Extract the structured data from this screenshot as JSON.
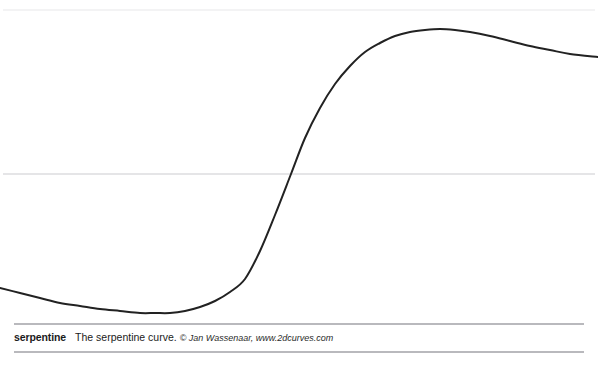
{
  "figure": {
    "background_color": "#ffffff",
    "width": 598,
    "height": 365
  },
  "rules": {
    "top_axis_color": "#efeff1",
    "mid_axis_color": "#dcdcdf",
    "caption_rule_color": "#b9b9bd"
  },
  "caption": {
    "name": "serpentine",
    "description": "The serpentine curve.",
    "credit": "© Jan Wassenaar, www.2dcurves.com"
  },
  "chart_data": {
    "type": "line",
    "title": "The serpentine curve.",
    "xlabel": "",
    "ylabel": "",
    "grid": false,
    "legend": null,
    "curve_color": "#222222",
    "curve_width": 2,
    "axis_lines": [
      {
        "name": "top-rule",
        "y_px": 10
      },
      {
        "name": "mid-axis",
        "y_px": 174
      }
    ],
    "xlim": [
      0,
      598
    ],
    "ylim": [
      323,
      0
    ],
    "annotations": [
      {
        "label": "minimum",
        "x": 155,
        "y": 313
      },
      {
        "label": "inflection",
        "x": 291,
        "y": 174
      },
      {
        "label": "maximum",
        "x": 440,
        "y": 29
      }
    ],
    "points": [
      {
        "x": 0,
        "y": 288
      },
      {
        "x": 20,
        "y": 293
      },
      {
        "x": 40,
        "y": 298
      },
      {
        "x": 60,
        "y": 303
      },
      {
        "x": 80,
        "y": 306
      },
      {
        "x": 100,
        "y": 309
      },
      {
        "x": 120,
        "y": 311
      },
      {
        "x": 140,
        "y": 313
      },
      {
        "x": 155,
        "y": 313
      },
      {
        "x": 170,
        "y": 313
      },
      {
        "x": 185,
        "y": 311
      },
      {
        "x": 200,
        "y": 307
      },
      {
        "x": 215,
        "y": 301
      },
      {
        "x": 230,
        "y": 292
      },
      {
        "x": 245,
        "y": 279
      },
      {
        "x": 260,
        "y": 251
      },
      {
        "x": 275,
        "y": 215
      },
      {
        "x": 291,
        "y": 174
      },
      {
        "x": 305,
        "y": 138
      },
      {
        "x": 320,
        "y": 108
      },
      {
        "x": 335,
        "y": 84
      },
      {
        "x": 350,
        "y": 66
      },
      {
        "x": 365,
        "y": 52
      },
      {
        "x": 380,
        "y": 43
      },
      {
        "x": 395,
        "y": 36
      },
      {
        "x": 410,
        "y": 32
      },
      {
        "x": 425,
        "y": 30
      },
      {
        "x": 440,
        "y": 29
      },
      {
        "x": 455,
        "y": 30
      },
      {
        "x": 470,
        "y": 32
      },
      {
        "x": 490,
        "y": 36
      },
      {
        "x": 510,
        "y": 41
      },
      {
        "x": 530,
        "y": 46
      },
      {
        "x": 550,
        "y": 50
      },
      {
        "x": 570,
        "y": 54
      },
      {
        "x": 598,
        "y": 57
      }
    ]
  }
}
